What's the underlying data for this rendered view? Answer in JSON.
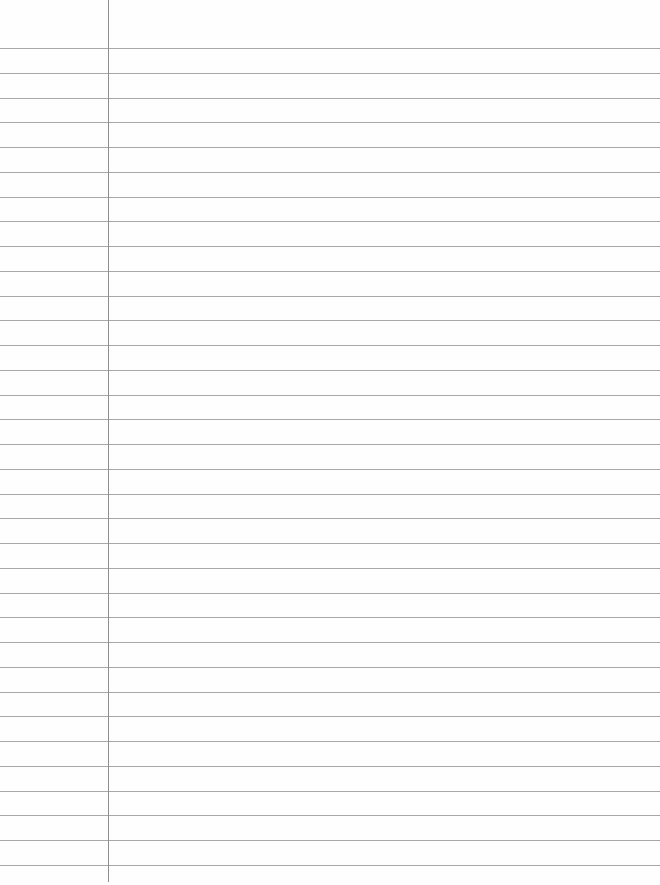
{
  "page": {
    "type": "lined-paper",
    "background_color": "#fefefe",
    "rule_color": "#a8a8a8",
    "margin_color": "#8f8f8f",
    "first_rule_y": 48,
    "rule_spacing": 24.75,
    "rule_count": 34,
    "margin_x": 108,
    "margin_bottom": 882
  }
}
